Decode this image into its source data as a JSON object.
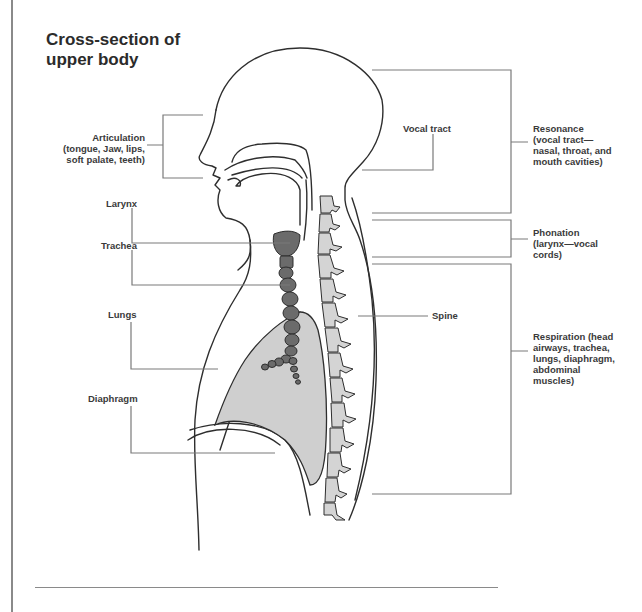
{
  "title": "Cross-section of\nupper body",
  "labels": {
    "articulation": "Articulation\n(tongue, Jaw, lips,\nsoft palate, teeth)",
    "larynx": "Larynx",
    "trachea": "Trachea",
    "lungs": "Lungs",
    "diaphragm": "Diaphragm",
    "vocal_tract": "Vocal tract",
    "spine": "Spine"
  },
  "groups": {
    "resonance": "Resonance\n(vocal tract—\nnasal, throat, and\nmouth cavities)",
    "phonation": "Phonation\n(larynx—vocal\ncords)",
    "respiration": "Respiration (head\nairways, trachea,\nlungs, diaphragm,\nabdominal\nmuscles)"
  },
  "colors": {
    "outline": "#2e2e2e",
    "leader": "#7a7a7a",
    "lung_fill": "#cfcfcf",
    "airway_fill": "#6b6b6b",
    "spine_fill": "#d4d4d4"
  }
}
